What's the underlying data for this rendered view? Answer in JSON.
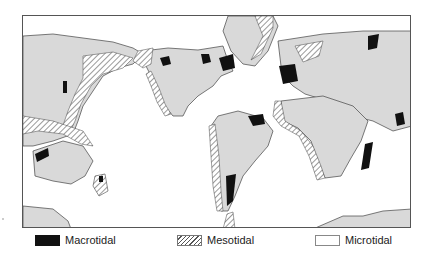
{
  "map": {
    "subject": "World map of coastal tidal ranges",
    "projection_frame": "rectangular",
    "colors": {
      "land": "#d9d9d9",
      "ocean": "#ffffff",
      "macrotidal": "#111111",
      "mesotidal_hatch": "#555555",
      "outline": "#444444"
    }
  },
  "legend": {
    "items": [
      {
        "key": "macrotidal",
        "label": "Macrotidal",
        "swatch": "solid-black"
      },
      {
        "key": "mesotidal",
        "label": "Mesotidal",
        "swatch": "diagonal-hatch"
      },
      {
        "key": "microtidal",
        "label": "Microtidal",
        "swatch": "white-box"
      }
    ]
  }
}
